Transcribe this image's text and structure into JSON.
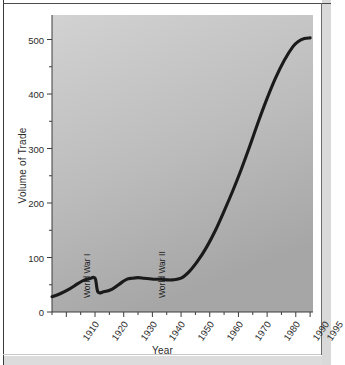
{
  "chart_data": {
    "type": "line",
    "title": "",
    "xlabel": "Year",
    "ylabel": "Volume of Trade",
    "xlim": [
      1905,
      1996
    ],
    "ylim": [
      0,
      545
    ],
    "grid": false,
    "legend": null,
    "x_ticks": [
      "1910",
      "1920",
      "1930",
      "1940",
      "1950",
      "1960",
      "1970",
      "1980",
      "1990",
      "1995"
    ],
    "x_tick_values": [
      1910,
      1920,
      1930,
      1940,
      1950,
      1960,
      1970,
      1980,
      1990,
      1995
    ],
    "y_ticks": [
      "0",
      "100",
      "200",
      "300",
      "400",
      "500"
    ],
    "y_tick_values": [
      0,
      100,
      200,
      300,
      400,
      500
    ],
    "y_minor_ticks": [
      50,
      150,
      250,
      350,
      450
    ],
    "series": [
      {
        "name": "Volume of Trade",
        "color": "#1a1a1a",
        "x": [
          1905,
          1908,
          1911,
          1914,
          1916,
          1918,
          1920,
          1921,
          1923,
          1926,
          1929,
          1931,
          1933,
          1935,
          1937,
          1939,
          1941,
          1943,
          1945,
          1947,
          1950,
          1953,
          1956,
          1959,
          1962,
          1965,
          1968,
          1971,
          1974,
          1977,
          1980,
          1983,
          1986,
          1989,
          1991,
          1993,
          1995
        ],
        "y": [
          28,
          34,
          42,
          52,
          58,
          61,
          62,
          37,
          37,
          42,
          53,
          60,
          62,
          63,
          62,
          61,
          60,
          60,
          59,
          59,
          62,
          75,
          95,
          120,
          150,
          185,
          222,
          262,
          305,
          350,
          392,
          430,
          462,
          487,
          497,
          502,
          503
        ]
      }
    ],
    "annotations": [
      {
        "text": "World War I",
        "x": 1917,
        "orientation": "vertical"
      },
      {
        "text": "World War II",
        "x": 1943,
        "orientation": "vertical"
      }
    ],
    "colors": {
      "line": "#1a1a1a",
      "plot_background_top": "#cfcfcf",
      "plot_background_bottom": "#a9a9a9",
      "axis": "#3c3c3c",
      "text": "#2b2b2b",
      "page": "#ffffff"
    }
  }
}
